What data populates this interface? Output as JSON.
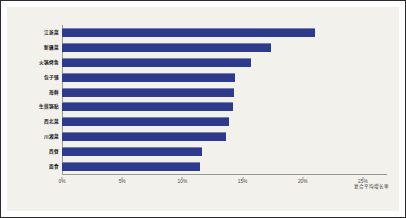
{
  "chart_data": {
    "type": "bar",
    "orientation": "horizontal",
    "title": "",
    "xlabel": "复合平均增长率",
    "ylabel": "",
    "xlim": [
      0,
      27
    ],
    "grid": false,
    "legend": null,
    "bar_color": "#2e3b8c",
    "background": "#f2f1ec",
    "unit": "%",
    "xticks": [
      {
        "value": 0,
        "label": "0%"
      },
      {
        "value": 5,
        "label": "5%"
      },
      {
        "value": 10,
        "label": "10%"
      },
      {
        "value": 15,
        "label": "15%"
      },
      {
        "value": 20,
        "label": "20%"
      },
      {
        "value": 25,
        "label": "25%"
      }
    ],
    "categories": [
      "江浙菜",
      "新疆菜",
      "火锅烤鱼",
      "包子铺",
      "海鲜",
      "生煎锅贴",
      "西北菜",
      "川湘菜",
      "西餐",
      "面食"
    ],
    "values": [
      21.0,
      17.4,
      15.7,
      14.4,
      14.3,
      14.2,
      13.9,
      13.6,
      11.6,
      11.5
    ]
  }
}
